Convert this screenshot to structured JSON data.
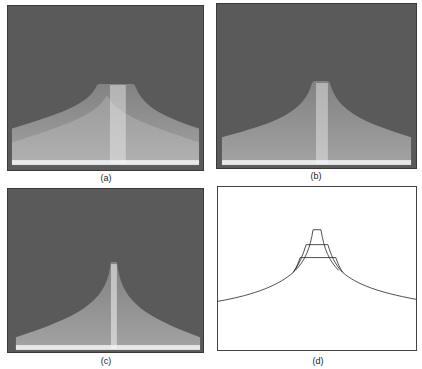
{
  "figure": {
    "panels": [
      {
        "label": "(a)",
        "kind": "photo",
        "description": "oscilloscope-like grayscale image with wide flat-top plateau"
      },
      {
        "label": "(b)",
        "kind": "photo",
        "description": "oscilloscope-like grayscale image with medium plateau"
      },
      {
        "label": "(c)",
        "kind": "photo",
        "description": "oscilloscope-like grayscale image with narrow sharp peak"
      },
      {
        "label": "(d)",
        "kind": "line-drawing",
        "description": "schematic overlay of three peak profiles with flat tops of decreasing width"
      }
    ]
  },
  "drawing": {
    "note": "Geometry for the schematic in panel (d). Coordinates are SVG units in a 200x164 viewBox; they describe the shape only and are not data values (no axes or scale are shown).",
    "viewbox": [
      200,
      164
    ],
    "profiles": [
      {
        "name": "wide-plateau",
        "plateau_half_width": 18,
        "plateau_y": 71
      },
      {
        "name": "medium-plateau",
        "plateau_half_width": 11,
        "plateau_y": 58
      },
      {
        "name": "narrow-peak",
        "plateau_half_width": 4,
        "plateau_y": 43
      }
    ],
    "center_x": 100,
    "edge_y_left": 115,
    "edge_y_right": 113
  },
  "colors": {
    "photo_bg": "#5a5a5a",
    "photo_glow": "#d8d8d8",
    "line": "#222222"
  }
}
